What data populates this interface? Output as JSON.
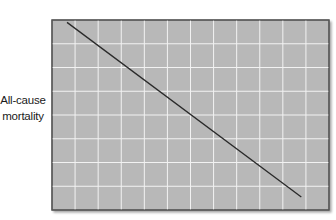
{
  "chart_data": {
    "type": "line",
    "title": "",
    "xlabel": "",
    "ylabel": "All-cause mortality",
    "ylabel_lines": [
      "All-cause",
      "mortality"
    ],
    "xlim": [
      0,
      12
    ],
    "ylim": [
      0,
      8
    ],
    "x_ticks": [],
    "y_ticks": [],
    "grid": true,
    "grid_columns": 12,
    "grid_rows": 8,
    "legend": null,
    "series": [
      {
        "name": "trend",
        "x": [
          0.65,
          10.8
        ],
        "y": [
          7.9,
          0.55
        ]
      }
    ],
    "annotations": []
  },
  "style": {
    "plot_background": "#b8b8b8",
    "grid_color": "#f2f2f2",
    "line_color": "#2a2a2a",
    "border_color": "#555555"
  }
}
